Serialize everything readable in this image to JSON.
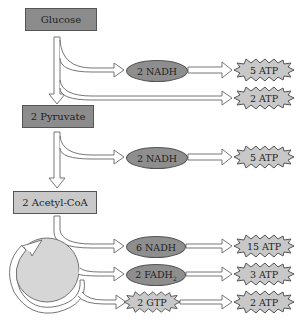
{
  "diagram": {
    "type": "metabolic-pathway",
    "stages": [
      {
        "label": "Glucose"
      },
      {
        "label": "2 Pyruvate"
      },
      {
        "label": "2 Acetyl-CoA"
      }
    ],
    "glycolysis": {
      "carrier": "2 NADH",
      "carrier_atp": "5 ATP",
      "direct_atp": "2 ATP"
    },
    "pyruvate_oxidation": {
      "carrier": "2 NADH",
      "carrier_atp": "5 ATP"
    },
    "citric_acid_cycle": {
      "outputs": [
        {
          "carrier": "6 NADH",
          "atp": "15 ATP"
        },
        {
          "carrier": "2 FADH",
          "carrier_sub": "2",
          "atp": "3 ATP"
        },
        {
          "carrier": "2 GTP",
          "atp": "2 ATP"
        }
      ]
    },
    "colors": {
      "dark_box": "#8c8c8c",
      "light_box": "#c9c9c9",
      "oval": "#8e8e8e",
      "star": "#c8c8c8",
      "cycle": "#d6d6d6",
      "outline": "#555555"
    }
  }
}
